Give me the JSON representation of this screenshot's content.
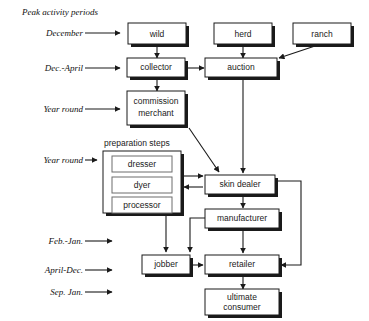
{
  "diagram": {
    "title": "Peak activity periods",
    "group_title": "preparation steps",
    "periods": [
      {
        "id": "p1",
        "label": "December"
      },
      {
        "id": "p2",
        "label": "Dec.-April"
      },
      {
        "id": "p3",
        "label": "Year round"
      },
      {
        "id": "p4",
        "label": "Year round"
      },
      {
        "id": "p5",
        "label": "Feb.-Jan."
      },
      {
        "id": "p6",
        "label": "April-Dec."
      },
      {
        "id": "p7",
        "label": "Sep. Jan."
      }
    ],
    "nodes": [
      {
        "id": "wild",
        "label": "wild"
      },
      {
        "id": "herd",
        "label": "herd"
      },
      {
        "id": "ranch",
        "label": "ranch"
      },
      {
        "id": "collector",
        "label": "collector"
      },
      {
        "id": "auction",
        "label": "auction"
      },
      {
        "id": "commission_merchant",
        "label_line1": "commission",
        "label_line2": "merchant"
      },
      {
        "id": "dresser",
        "label": "dresser"
      },
      {
        "id": "dyer",
        "label": "dyer"
      },
      {
        "id": "processor",
        "label": "processor"
      },
      {
        "id": "skin_dealer",
        "label": "skin dealer"
      },
      {
        "id": "manufacturer",
        "label": "manufacturer"
      },
      {
        "id": "jobber",
        "label": "jobber"
      },
      {
        "id": "retailer",
        "label": "retailer"
      },
      {
        "id": "ultimate_consumer",
        "label_line1": "ultimate",
        "label_line2": "consumer"
      }
    ],
    "colors": {
      "stroke": "#1a1a1a",
      "shadow": "#1a1a1a",
      "sub_stroke": "#6d6d6d",
      "background": "#ffffff"
    }
  }
}
